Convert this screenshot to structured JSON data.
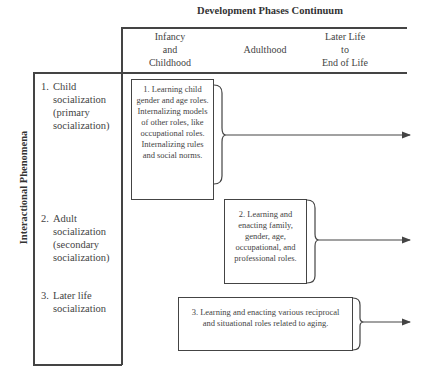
{
  "diagram": {
    "title": "Development Phases Continuum",
    "vertical_axis_label": "Interactional Phenomena",
    "columns": [
      {
        "label": "Infancy\nand\nChildhood"
      },
      {
        "label": "Adulthood"
      },
      {
        "label": "Later Life\nto\nEnd of Life"
      }
    ],
    "rows": [
      {
        "number": "1.",
        "lines": [
          "Child",
          "socialization",
          "(primary",
          "socialization)"
        ]
      },
      {
        "number": "2.",
        "lines": [
          "Adult",
          "socialization",
          "(secondary",
          "socialization)"
        ]
      },
      {
        "number": "3.",
        "lines": [
          "Later life",
          "socialization"
        ]
      }
    ],
    "boxes": [
      {
        "text": "1. Learning child gender and age roles. Internalizing models of other roles, like occupational roles. Internalizing rules and social norms."
      },
      {
        "text": "2. Learning and enacting family, gender, age, occupational, and professional roles."
      },
      {
        "text": "3. Learning and enacting various reciprocal and situational roles related to aging."
      }
    ],
    "colors": {
      "line": "#444444",
      "text": "#3a3a3a",
      "background": "#ffffff"
    }
  }
}
